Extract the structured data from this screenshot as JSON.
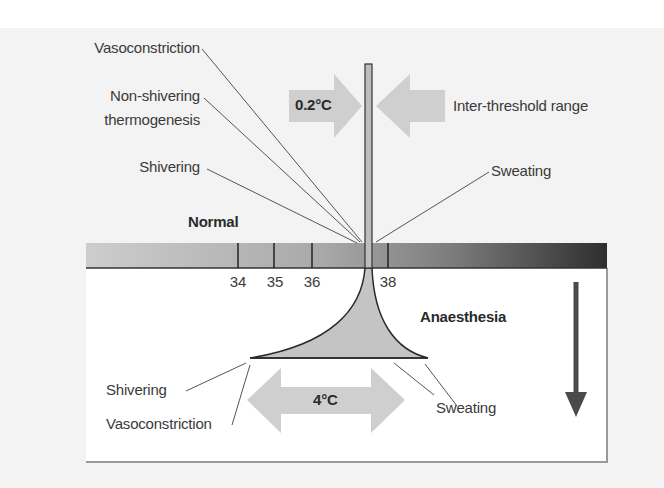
{
  "figure": {
    "top_labels": {
      "vasoconstriction": "Vasoconstriction",
      "non_shivering_line1": "Non-shivering",
      "non_shivering_line2": "thermogenesis",
      "shivering": "Shivering",
      "sweating": "Sweating",
      "normal": "Normal",
      "inter_threshold_value": "0.2°C",
      "inter_threshold_label": "Inter-threshold range"
    },
    "scale": {
      "ticks": [
        "34",
        "35",
        "36",
        "38"
      ]
    },
    "bottom_labels": {
      "anaesthesia": "Anaesthesia",
      "shivering": "Shivering",
      "vasoconstriction": "Vasoconstriction",
      "sweating": "Sweating",
      "range_value": "4°C"
    },
    "colors": {
      "page_bg": "#f3f3f3",
      "arrow_fill": "#cfcfcf",
      "bar_light": "#cacaca",
      "bar_dark": "#2e2e2e",
      "funnel_fill": "#c4c4c4",
      "down_arrow": "#4a4a4a"
    }
  }
}
